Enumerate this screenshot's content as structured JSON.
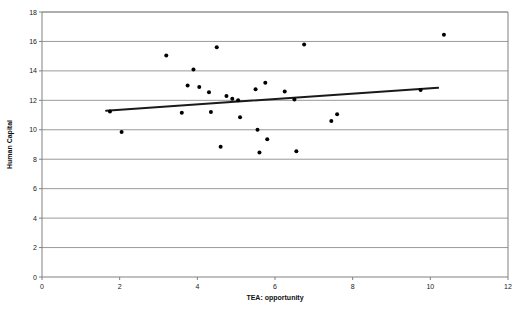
{
  "chart_data": {
    "type": "scatter",
    "title": "",
    "xlabel": "TEA: opportunity",
    "ylabel": "Human Capital",
    "xlim": [
      0,
      12
    ],
    "ylim": [
      0,
      18
    ],
    "xticks": [
      0,
      2,
      4,
      6,
      8,
      10,
      12
    ],
    "yticks": [
      0,
      2,
      4,
      6,
      8,
      10,
      12,
      14,
      16,
      18
    ],
    "xtick_labels": [
      "0",
      "2",
      "4",
      "6",
      "8",
      "10",
      "12"
    ],
    "ytick_labels": [
      "0",
      "2",
      "4",
      "6",
      "8",
      "10",
      "12",
      "14",
      "16",
      "18"
    ],
    "grid": "horizontal",
    "legend": "none",
    "marker_color": "#000000",
    "marker_shape": "circle",
    "gridline_color": "#808080",
    "axis_color": "#808080",
    "points": [
      {
        "x": 1.75,
        "y": 11.25
      },
      {
        "x": 2.05,
        "y": 9.85
      },
      {
        "x": 3.2,
        "y": 15.05
      },
      {
        "x": 3.6,
        "y": 11.15
      },
      {
        "x": 3.75,
        "y": 13.0
      },
      {
        "x": 3.9,
        "y": 14.1
      },
      {
        "x": 4.05,
        "y": 12.9
      },
      {
        "x": 4.3,
        "y": 12.55
      },
      {
        "x": 4.35,
        "y": 11.2
      },
      {
        "x": 4.5,
        "y": 15.6
      },
      {
        "x": 4.6,
        "y": 8.85
      },
      {
        "x": 4.75,
        "y": 12.3
      },
      {
        "x": 4.9,
        "y": 12.1
      },
      {
        "x": 5.05,
        "y": 12.0
      },
      {
        "x": 5.1,
        "y": 10.85
      },
      {
        "x": 5.5,
        "y": 12.75
      },
      {
        "x": 5.55,
        "y": 10.0
      },
      {
        "x": 5.6,
        "y": 8.45
      },
      {
        "x": 5.75,
        "y": 13.2
      },
      {
        "x": 5.8,
        "y": 9.35
      },
      {
        "x": 6.25,
        "y": 12.6
      },
      {
        "x": 6.5,
        "y": 12.05
      },
      {
        "x": 6.55,
        "y": 8.55
      },
      {
        "x": 6.75,
        "y": 15.8
      },
      {
        "x": 7.45,
        "y": 10.6
      },
      {
        "x": 7.6,
        "y": 11.05
      },
      {
        "x": 9.75,
        "y": 12.7
      },
      {
        "x": 10.35,
        "y": 16.45
      }
    ],
    "trendline": {
      "label": "linear trend",
      "x_start": 1.65,
      "y_start": 11.3,
      "x_end": 10.2,
      "y_end": 12.85,
      "color": "#1a1a1a",
      "width": 2
    }
  }
}
